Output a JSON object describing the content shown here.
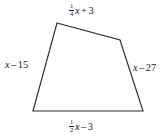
{
  "figure": {
    "kind": "quadrilateral",
    "stroke_color": "#2b2b2b",
    "fill_color": "#ffffff",
    "background_color": "#ffffff",
    "vertices": [
      {
        "name": "top-left",
        "x": 57,
        "y": 23
      },
      {
        "name": "top-right",
        "x": 120,
        "y": 40
      },
      {
        "name": "bottom-right",
        "x": 143,
        "y": 111
      },
      {
        "name": "bottom-left",
        "x": 33,
        "y": 111
      }
    ],
    "labels": {
      "top": {
        "text": "1/4 x + 3",
        "fraction_numerator": "1",
        "fraction_denominator": "4",
        "variable": "x",
        "operator": "+",
        "constant": "3"
      },
      "left": {
        "text": "x - 15",
        "variable": "x",
        "operator": "–",
        "constant": "15"
      },
      "right": {
        "text": "x - 27",
        "variable": "x",
        "operator": "–",
        "constant": "27"
      },
      "bottom": {
        "text": "1/2 x - 3",
        "fraction_numerator": "1",
        "fraction_denominator": "2",
        "variable": "x",
        "operator": "–",
        "constant": "3"
      }
    }
  }
}
